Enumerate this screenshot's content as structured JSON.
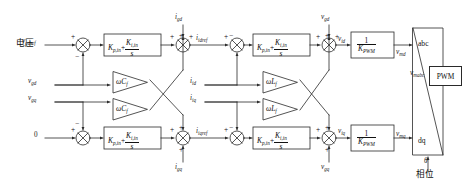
{
  "diagram": {
    "type": "control-block-diagram",
    "line_color": "#2a2a2a",
    "text_color": "#111111"
  },
  "annotations": {
    "voltage_cn": "电压",
    "phase_cn": "相位"
  },
  "inputs": [
    {
      "name": "v-gdref-input",
      "label_main": "v",
      "label_sub": "gdref"
    },
    {
      "name": "v-gd-input",
      "label_main": "v",
      "label_sub": "gd"
    },
    {
      "name": "v-gq-input",
      "label_main": "v",
      "label_sub": "gq"
    },
    {
      "name": "zero-input",
      "label_main": "0",
      "label_sub": ""
    }
  ],
  "signals": {
    "i_gd": {
      "main": "i",
      "sub": "gd"
    },
    "i_gq": {
      "main": "i",
      "sub": "gq"
    },
    "i_idref": {
      "main": "i",
      "sub": "idref"
    },
    "i_iqref": {
      "main": "i",
      "sub": "iqref"
    },
    "i_id": {
      "main": "i",
      "sub": "id"
    },
    "i_iq": {
      "main": "i",
      "sub": "iq"
    },
    "v_gd": {
      "main": "v",
      "sub": "gd"
    },
    "v_gq": {
      "main": "v",
      "sub": "gq"
    },
    "v_id": {
      "main": "v",
      "sub": "id"
    },
    "v_iq": {
      "main": "v",
      "sub": "iq"
    },
    "v_md": {
      "main": "v",
      "sub": "md"
    },
    "v_mq": {
      "main": "v",
      "sub": "mq"
    },
    "v_mabc": {
      "main": "v",
      "sub": "mabc"
    },
    "theta": {
      "main": "θ",
      "sub": ""
    }
  },
  "blocks": {
    "pi_outer_d": {
      "name": "pi-controller-outer-d",
      "kp": "K",
      "kp_sub": "p,in",
      "ki": "K",
      "ki_sub": "i,in",
      "den": "s",
      "op": "+"
    },
    "pi_outer_q": {
      "name": "pi-controller-outer-q",
      "kp": "K",
      "kp_sub": "p,in",
      "ki": "K",
      "ki_sub": "i,in",
      "den": "s",
      "op": "+"
    },
    "pi_inner_d": {
      "name": "pi-controller-inner-d",
      "kp": "K",
      "kp_sub": "p,in",
      "ki": "K",
      "ki_sub": "i,in",
      "den": "s",
      "op": "+"
    },
    "pi_inner_q": {
      "name": "pi-controller-inner-q",
      "kp": "K",
      "kp_sub": "p,in",
      "ki": "K",
      "ki_sub": "i,in",
      "den": "s",
      "op": "+"
    },
    "pwm_gain_d": {
      "name": "pwm-gain-d",
      "num": "1",
      "den_main": "K",
      "den_sub": "PWM"
    },
    "pwm_gain_q": {
      "name": "pwm-gain-q",
      "num": "1",
      "den_main": "K",
      "den_sub": "PWM"
    },
    "wcf_top": {
      "name": "omega-cf-gain-top",
      "label": "ωC",
      "sub": "f"
    },
    "wcf_bottom": {
      "name": "omega-cf-gain-bottom",
      "label": "ωC",
      "sub": "f"
    },
    "wlf_top": {
      "name": "omega-lf-gain-top",
      "label": "ωL",
      "sub": "f"
    },
    "wlf_bottom": {
      "name": "omega-lf-gain-bottom",
      "label": "ωL",
      "sub": "f"
    },
    "transform": {
      "name": "dq-to-abc-transform",
      "top_label": "abc",
      "bottom_label": "dq"
    },
    "pwm": {
      "name": "pwm-modulator",
      "label": "PWM"
    }
  },
  "summers": [
    {
      "name": "summer-outer-d",
      "signs": [
        "+",
        "−"
      ]
    },
    {
      "name": "summer-outer-q",
      "signs": [
        "+",
        "−"
      ]
    },
    {
      "name": "summer-cross-d",
      "signs": [
        "+",
        "+",
        "+"
      ]
    },
    {
      "name": "summer-cross-q",
      "signs": [
        "+",
        "+",
        "+"
      ]
    },
    {
      "name": "summer-inner-d",
      "signs": [
        "+",
        "−"
      ]
    },
    {
      "name": "summer-inner-q",
      "signs": [
        "+",
        "−"
      ]
    },
    {
      "name": "summer-decouple-d",
      "signs": [
        "+",
        "+",
        "+"
      ]
    },
    {
      "name": "summer-decouple-q",
      "signs": [
        "+",
        "+",
        "+"
      ]
    }
  ]
}
